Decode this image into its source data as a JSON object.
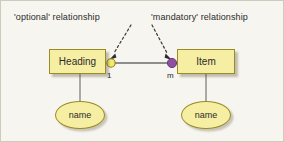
{
  "diagram": {
    "background_color": "#f7f5ef",
    "entity_fill": "#f6eea2",
    "entity_stroke": "#9a8b23",
    "optional_marker_color": "#f5e96b",
    "mandatory_marker_color": "#8e4fa0",
    "connector_color": "#6b6b6b",
    "annotations": [
      {
        "id": "optional",
        "text": "'optional' relationship",
        "points_to": "optional-marker-icon"
      },
      {
        "id": "mandatory",
        "text": "'mandatory' relationship",
        "points_to": "mandatory-marker-icon"
      }
    ],
    "entities": [
      {
        "id": "heading",
        "label": "Heading",
        "attribute": "name",
        "cardinality": "1",
        "marker": "optional"
      },
      {
        "id": "item",
        "label": "Item",
        "attribute": "name",
        "cardinality": "m",
        "marker": "mandatory"
      }
    ]
  }
}
